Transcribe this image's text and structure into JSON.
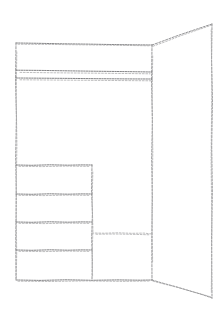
{
  "canvas": {
    "width": 224,
    "height": 313,
    "background_color": "#ffffff",
    "style": "hand-drawn sketch wireframe, dashed pencil strokes"
  },
  "stroke_colors": {
    "primary": "#8e8e90",
    "faint": "#a9a9ab",
    "dense": "#7c7c7e"
  },
  "diagram": {
    "title": "",
    "description": "Two-panel perspective wireframe: a flat front panel on the left with a header band and a stacked four-row column, plus an angled side panel receding to the right.",
    "front_panel": {
      "name": "front-panel",
      "outline": "16,43 152,45 152,280 16,280",
      "corners": {
        "top_left": [
          16,
          43
        ],
        "top_right": [
          152,
          45
        ],
        "bottom_right": [
          152,
          280
        ],
        "bottom_left": [
          16,
          280
        ]
      },
      "header_band": {
        "name": "header-band",
        "top_rule": [
          [
            16,
            70
          ],
          [
            152,
            72
          ]
        ],
        "bottom_rule": [
          [
            16,
            78
          ],
          [
            152,
            79
          ]
        ]
      },
      "mid_rule": {
        "name": "mid-divider-rule",
        "from": [
          92,
          233
        ],
        "to": [
          152,
          234
        ]
      }
    },
    "stacked_column": {
      "name": "stacked-row-column",
      "bounds": {
        "left": 16,
        "right": 92,
        "top": 165,
        "bottom": 280
      },
      "right_edge": [
        [
          92,
          165
        ],
        [
          92,
          280
        ]
      ],
      "row_dividers": [
        [
          [
            16,
            165
          ],
          [
            92,
            165
          ]
        ],
        [
          [
            16,
            194
          ],
          [
            92,
            194
          ]
        ],
        [
          [
            16,
            222
          ],
          [
            92,
            222
          ]
        ],
        [
          [
            16,
            250
          ],
          [
            92,
            250
          ]
        ]
      ],
      "row_count": 4
    },
    "side_panel": {
      "name": "side-panel-perspective",
      "outline": "152,45 212,24 212,298 152,280",
      "corners": {
        "near_top": [
          152,
          45
        ],
        "far_top": [
          212,
          24
        ],
        "far_bottom": [
          212,
          298
        ],
        "near_bottom": [
          152,
          280
        ]
      },
      "top_edge": [
        [
          152,
          45
        ],
        [
          212,
          24
        ]
      ],
      "far_edge": [
        [
          212,
          24
        ],
        [
          212,
          298
        ]
      ],
      "bottom_edge": [
        [
          152,
          280
        ],
        [
          212,
          298
        ]
      ]
    },
    "shared_vertical": {
      "name": "shared-vertical-seam",
      "from": [
        152,
        45
      ],
      "to": [
        152,
        280
      ]
    }
  }
}
